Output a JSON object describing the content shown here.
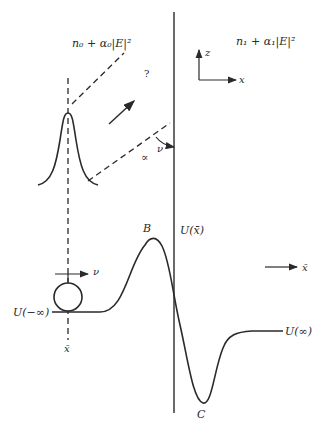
{
  "diagram": {
    "type": "physics-schematic",
    "media": {
      "left": {
        "label": "n₀ + α₀|E|²"
      },
      "right": {
        "label": "n₁ + α₁|E|²"
      }
    },
    "axes": {
      "z_label": "z",
      "x_label": "x"
    },
    "unknown_marker": "?",
    "angle_labels": {
      "nu": "ν",
      "alpha": "∝"
    },
    "potential": {
      "label": "U(x̄)",
      "peak_label": "B",
      "trough_label": "C",
      "left_asymptote": "U(−∞)",
      "right_asymptote": "U(∞)"
    },
    "particle": {
      "velocity_label": "ν",
      "position_label": "x̄"
    },
    "direction_arrow_label": "x̄",
    "colors": {
      "ink": "#2a2a2a",
      "background": "#ffffff"
    }
  }
}
